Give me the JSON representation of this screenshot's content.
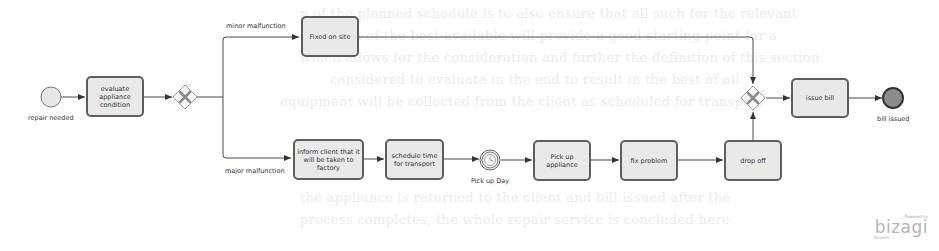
{
  "diagram": {
    "type": "BPMN process",
    "start_event": {
      "label": "repair needed"
    },
    "end_event": {
      "label": "bill issued"
    },
    "tasks": {
      "evaluate": "evaluate appliance condition",
      "fixed_on_site": "Fixed on site",
      "inform_client": "inform client that it will be taken to factory",
      "schedule": "schedule time for transport",
      "pick_up": "Pick up appliance",
      "fix_problem": "fix problem",
      "drop_off": "drop off",
      "issue_bill": "issue bill"
    },
    "timer_event": {
      "label": "Pick up Day"
    },
    "flows": {
      "minor": "minor malfunction",
      "major": "major malfunction"
    },
    "colors": {
      "task_fill": "#e9e9e9",
      "task_border": "#5e5e5e",
      "line": "#4a4a4a",
      "end_fill": "#8c8c8c",
      "gateway_x": "#8a8a8a"
    }
  },
  "branding": {
    "powered_by": "Powered by",
    "name": "bizagi",
    "edition": "Modeler"
  }
}
